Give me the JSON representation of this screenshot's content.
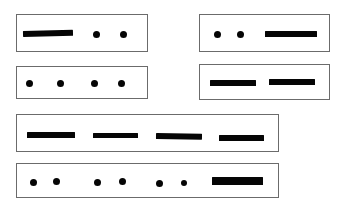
{
  "figure": {
    "background_color": "#ffffff",
    "mark_color": "#050505",
    "box_border_color": "#6b6b6b",
    "width": 341,
    "height": 207
  },
  "groups": [
    {
      "id": "group-1",
      "label": "row-1-left",
      "box": {
        "x": 16,
        "y": 14,
        "w": 132,
        "h": 38
      },
      "sequence": "dash dot dot",
      "marks": [
        {
          "type": "dash",
          "x": 22,
          "y": 30,
          "w": 50,
          "h": 6,
          "slant": "down"
        },
        {
          "type": "dot",
          "x": 92,
          "y": 30,
          "w": 7,
          "h": 7
        },
        {
          "type": "dot",
          "x": 119,
          "y": 30,
          "w": 7,
          "h": 7
        }
      ]
    },
    {
      "id": "group-2",
      "label": "row-1-right",
      "box": {
        "x": 199,
        "y": 14,
        "w": 131,
        "h": 38
      },
      "sequence": "dot dot dash",
      "marks": [
        {
          "type": "dot",
          "x": 213,
          "y": 30,
          "w": 7,
          "h": 7
        },
        {
          "type": "dot",
          "x": 236,
          "y": 30,
          "w": 7,
          "h": 7
        },
        {
          "type": "dash",
          "x": 264,
          "y": 30,
          "w": 52,
          "h": 6,
          "slant": "none"
        }
      ]
    },
    {
      "id": "group-3",
      "label": "row-2-left",
      "box": {
        "x": 16,
        "y": 66,
        "w": 132,
        "h": 33
      },
      "sequence": "dot dot dot dot",
      "marks": [
        {
          "type": "dot",
          "x": 25,
          "y": 79,
          "w": 7,
          "h": 7
        },
        {
          "type": "dot",
          "x": 56,
          "y": 79,
          "w": 7,
          "h": 7
        },
        {
          "type": "dot",
          "x": 90,
          "y": 79,
          "w": 7,
          "h": 7
        },
        {
          "type": "dot",
          "x": 117,
          "y": 79,
          "w": 7,
          "h": 7
        }
      ]
    },
    {
      "id": "group-4",
      "label": "row-2-right",
      "box": {
        "x": 199,
        "y": 64,
        "w": 131,
        "h": 36
      },
      "sequence": "dash dash",
      "marks": [
        {
          "type": "dash",
          "x": 209,
          "y": 79,
          "w": 46,
          "h": 6,
          "slant": "none"
        },
        {
          "type": "dash",
          "x": 268,
          "y": 78,
          "w": 46,
          "h": 6,
          "slant": "none"
        }
      ]
    },
    {
      "id": "group-5",
      "label": "row-3-wide",
      "box": {
        "x": 16,
        "y": 114,
        "w": 263,
        "h": 38
      },
      "sequence": "dash dash dash dash",
      "marks": [
        {
          "type": "dash",
          "x": 26,
          "y": 131,
          "w": 48,
          "h": 6,
          "slant": "none"
        },
        {
          "type": "dash",
          "x": 92,
          "y": 132,
          "w": 45,
          "h": 5,
          "slant": "none"
        },
        {
          "type": "dash",
          "x": 155,
          "y": 132,
          "w": 46,
          "h": 6,
          "slant": "up"
        },
        {
          "type": "dash",
          "x": 218,
          "y": 134,
          "w": 45,
          "h": 6,
          "slant": "none"
        }
      ]
    },
    {
      "id": "group-6",
      "label": "row-4-wide",
      "box": {
        "x": 16,
        "y": 163,
        "w": 263,
        "h": 35
      },
      "sequence": "dot dot dot dot dot dot dash",
      "marks": [
        {
          "type": "dot",
          "x": 29,
          "y": 178,
          "w": 7,
          "h": 7
        },
        {
          "type": "dot",
          "x": 52,
          "y": 177,
          "w": 7,
          "h": 7
        },
        {
          "type": "dot",
          "x": 93,
          "y": 178,
          "w": 7,
          "h": 7
        },
        {
          "type": "dot",
          "x": 118,
          "y": 177,
          "w": 7,
          "h": 7
        },
        {
          "type": "dot",
          "x": 155,
          "y": 179,
          "w": 7,
          "h": 7
        },
        {
          "type": "dot",
          "x": 180,
          "y": 179,
          "w": 6,
          "h": 6
        },
        {
          "type": "dash",
          "x": 211,
          "y": 176,
          "w": 51,
          "h": 8,
          "slant": "none"
        }
      ]
    }
  ]
}
